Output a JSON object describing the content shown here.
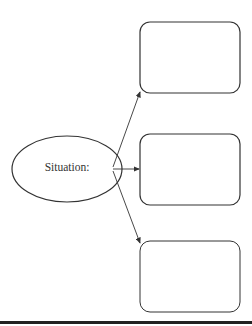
{
  "diagram": {
    "center_node": {
      "label": "Situation:",
      "shape": "ellipse"
    },
    "outcome_boxes": [
      {
        "label": "",
        "position": "top"
      },
      {
        "label": "",
        "position": "middle"
      },
      {
        "label": "",
        "position": "bottom"
      }
    ],
    "edges": [
      {
        "from": "Situation:",
        "to": "top"
      },
      {
        "from": "Situation:",
        "to": "middle"
      },
      {
        "from": "Situation:",
        "to": "bottom"
      }
    ],
    "colors": {
      "stroke": "#333333",
      "rule": "#222222"
    }
  }
}
